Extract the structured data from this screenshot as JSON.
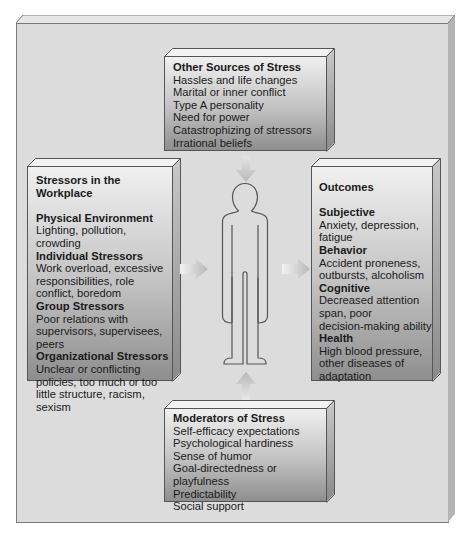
{
  "diagram": {
    "other_sources": {
      "title": "Other Sources of Stress",
      "items": [
        "Hassles and life changes",
        "Marital or inner conflict",
        "Type A personality",
        "Need for power",
        "Catastrophizing of stressors",
        "Irrational beliefs"
      ]
    },
    "workplace": {
      "title": "Stressors in the Workplace",
      "sections": [
        {
          "heading": "Physical Environment",
          "lines": [
            "Lighting, pollution,",
            "crowding"
          ]
        },
        {
          "heading": "Individual Stressors",
          "lines": [
            "Work overload, excessive",
            "responsibilities, role",
            "conflict, boredom"
          ]
        },
        {
          "heading": "Group Stressors",
          "lines": [
            "Poor relations with",
            "supervisors, supervisees,",
            "peers"
          ]
        },
        {
          "heading": "Organizational Stressors",
          "lines": [
            "Unclear or conflicting",
            "policies, too much or too",
            "little structure, racism,",
            "sexism"
          ]
        }
      ]
    },
    "outcomes": {
      "title": "Outcomes",
      "sections": [
        {
          "heading": "Subjective",
          "lines": [
            "Anxiety, depression,",
            "fatigue"
          ]
        },
        {
          "heading": "Behavior",
          "lines": [
            "Accident proneness,",
            "outbursts, alcoholism"
          ]
        },
        {
          "heading": "Cognitive",
          "lines": [
            "Decreased attention",
            "span, poor",
            "decision-making ability"
          ]
        },
        {
          "heading": "Health",
          "lines": [
            "High blood pressure,",
            "other diseases of",
            "adaptation"
          ]
        }
      ]
    },
    "moderators": {
      "title": "Moderators of Stress",
      "items": [
        "Self-efficacy expectations",
        "Psychological hardiness",
        "Sense of humor",
        "Goal-directedness or playfulness",
        "Predictability",
        "Social support"
      ]
    },
    "center_figure": "person-outline",
    "colors": {
      "panel": "#dcdcdc",
      "box_top": "#f0f0f0",
      "box_bottom": "#8e8e8e",
      "arrow": "#c4c4c4",
      "figure_stroke": "#555555"
    }
  }
}
